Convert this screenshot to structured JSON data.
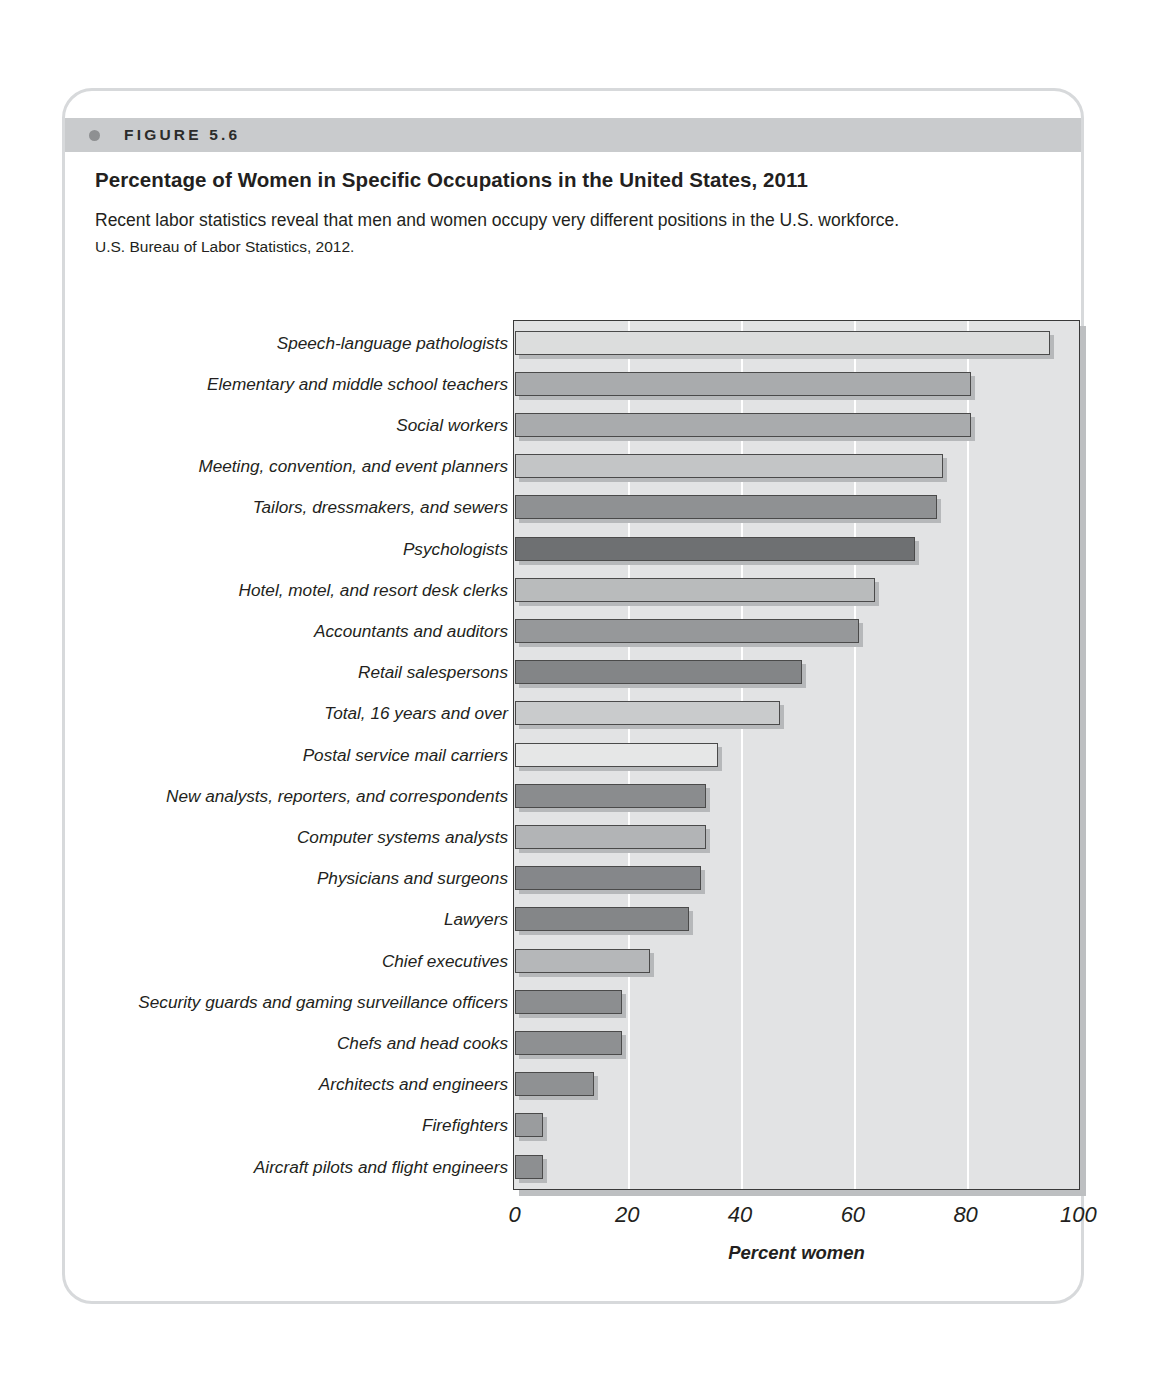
{
  "figure": {
    "label": "FIGURE 5.6",
    "title": "Percentage of Women in Specific Occupations in the United States, 2011",
    "description": "Recent labor statistics reveal that men and women occupy very different positions in the U.S. workforce.",
    "source": "U.S. Bureau of Labor Statistics, 2012."
  },
  "chart_data": {
    "type": "bar",
    "orientation": "horizontal",
    "title": "Percentage of Women in Specific Occupations in the United States, 2011",
    "xlabel": "Percent women",
    "ylabel": "",
    "xlim": [
      0,
      100
    ],
    "xticks": [
      0,
      20,
      40,
      60,
      80,
      100
    ],
    "grid": "vertical",
    "legend": "none",
    "categories": [
      "Speech-language pathologists",
      "Elementary and middle school teachers",
      "Social workers",
      "Meeting, convention, and event planners",
      "Tailors, dressmakers, and sewers",
      "Psychologists",
      "Hotel, motel, and resort desk clerks",
      "Accountants and auditors",
      "Retail salespersons",
      "Total, 16 years and over",
      "Postal service mail carriers",
      "New analysts, reporters, and correspondents",
      "Computer systems analysts",
      "Physicians and surgeons",
      "Lawyers",
      "Chief executives",
      "Security guards and gaming surveillance officers",
      "Chefs and head cooks",
      "Architects and engineers",
      "Firefighters",
      "Aircraft pilots and flight engineers"
    ],
    "values": [
      95,
      81,
      81,
      76,
      75,
      71,
      64,
      61,
      51,
      47,
      36,
      34,
      34,
      33,
      31,
      24,
      19,
      19,
      14,
      5,
      5
    ],
    "bar_colors": [
      "#dcdddd",
      "#a9abad",
      "#a9abad",
      "#c3c5c6",
      "#8f9193",
      "#6e7072",
      "#b9bbbc",
      "#96989a",
      "#838587",
      "#c9cbcc",
      "#e6e7e7",
      "#8a8c8e",
      "#b2b4b6",
      "#85878a",
      "#848688",
      "#b5b7b9",
      "#8c8e90",
      "#8e9092",
      "#8f9193",
      "#9a9c9e",
      "#8d8f91"
    ]
  },
  "colors": {
    "frame_border": "#d7d9db",
    "band_background": "#c9cbcd",
    "plot_background": "#e2e3e4",
    "gridline": "#ffffff",
    "bar_outline": "#4a4a4a"
  }
}
